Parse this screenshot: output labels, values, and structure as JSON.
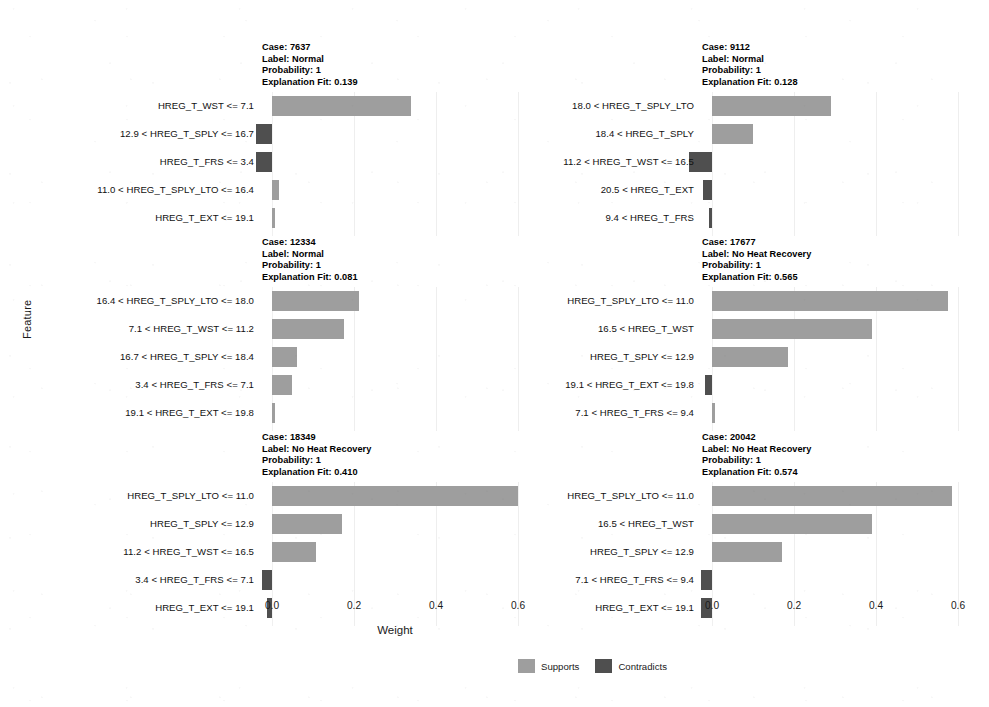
{
  "chart_data": {
    "type": "bar",
    "title": "",
    "xlabel": "Weight",
    "ylabel": "Feature",
    "xlim": [
      -0.06,
      0.66
    ],
    "xticks": [
      0.0,
      0.2,
      0.4,
      0.6
    ],
    "xticklabels": [
      "0.0",
      "0.2",
      "0.4",
      "0.6"
    ],
    "grid": true,
    "orientation": "horizontal",
    "legend": {
      "position": "bottom-center",
      "entries": [
        {
          "label": "Supports",
          "color": "#9e9e9e"
        },
        {
          "label": "Contradicts",
          "color": "#4f4f4f"
        }
      ]
    },
    "panels": [
      {
        "case_label": "Case: 7637",
        "class_label": "Label: Normal",
        "probability": "Probability: 1",
        "explanation_fit": "Explanation Fit: 0.139",
        "categories": [
          "HREG_T_WST <= 7.1",
          "12.9 < HREG_T_SPLY <= 16.7",
          "HREG_T_FRS <= 3.4",
          "11.0 < HREG_T_SPLY_LTO <= 16.4",
          "HREG_T_EXT <= 19.1"
        ],
        "values": [
          0.34,
          -0.04,
          -0.04,
          0.017,
          0.008
        ]
      },
      {
        "case_label": "Case: 9112",
        "class_label": "Label: Normal",
        "probability": "Probability: 1",
        "explanation_fit": "Explanation Fit: 0.128",
        "categories": [
          "18.0 < HREG_T_SPLY_LTO",
          "18.4 < HREG_T_SPLY",
          "11.2 < HREG_T_WST <= 16.5",
          "20.5 < HREG_T_EXT",
          "9.4 < HREG_T_FRS"
        ],
        "values": [
          0.29,
          0.1,
          -0.055,
          -0.022,
          -0.008
        ]
      },
      {
        "case_label": "Case: 12334",
        "class_label": "Label: Normal",
        "probability": "Probability: 1",
        "explanation_fit": "Explanation Fit: 0.081",
        "categories": [
          "16.4 < HREG_T_SPLY_LTO <= 18.0",
          "7.1 < HREG_T_WST <= 11.2",
          "16.7 < HREG_T_SPLY <= 18.4",
          "3.4 < HREG_T_FRS <= 7.1",
          "19.1 < HREG_T_EXT <= 19.8"
        ],
        "values": [
          0.213,
          0.175,
          0.06,
          0.048,
          0.002
        ]
      },
      {
        "case_label": "Case: 17677",
        "class_label": "Label: No Heat Recovery",
        "probability": "Probability: 1",
        "explanation_fit": "Explanation Fit: 0.565",
        "categories": [
          "HREG_T_SPLY_LTO <= 11.0",
          "16.5 < HREG_T_WST",
          "HREG_T_SPLY <= 12.9",
          "19.1 < HREG_T_EXT <= 19.8",
          "7.1 < HREG_T_FRS <= 9.4"
        ],
        "values": [
          0.575,
          0.39,
          0.185,
          -0.017,
          0.002
        ]
      },
      {
        "case_label": "Case: 18349",
        "class_label": "Label: No Heat Recovery",
        "probability": "Probability: 1",
        "explanation_fit": "Explanation Fit: 0.410",
        "categories": [
          "HREG_T_SPLY_LTO <= 11.0",
          "HREG_T_SPLY <= 12.9",
          "11.2 < HREG_T_WST <= 16.5",
          "3.4 < HREG_T_FRS <= 7.1",
          "HREG_T_EXT <= 19.1"
        ],
        "values": [
          0.6,
          0.17,
          0.108,
          -0.025,
          -0.012
        ]
      },
      {
        "case_label": "Case: 20042",
        "class_label": "Label: No Heat Recovery",
        "probability": "Probability: 1",
        "explanation_fit": "Explanation Fit: 0.574",
        "categories": [
          "HREG_T_SPLY_LTO <= 11.0",
          "16.5 < HREG_T_WST",
          "HREG_T_SPLY <= 12.9",
          "7.1 < HREG_T_FRS <= 9.4",
          "HREG_T_EXT <= 19.1"
        ],
        "values": [
          0.585,
          0.39,
          0.17,
          -0.028,
          -0.028
        ]
      }
    ]
  }
}
